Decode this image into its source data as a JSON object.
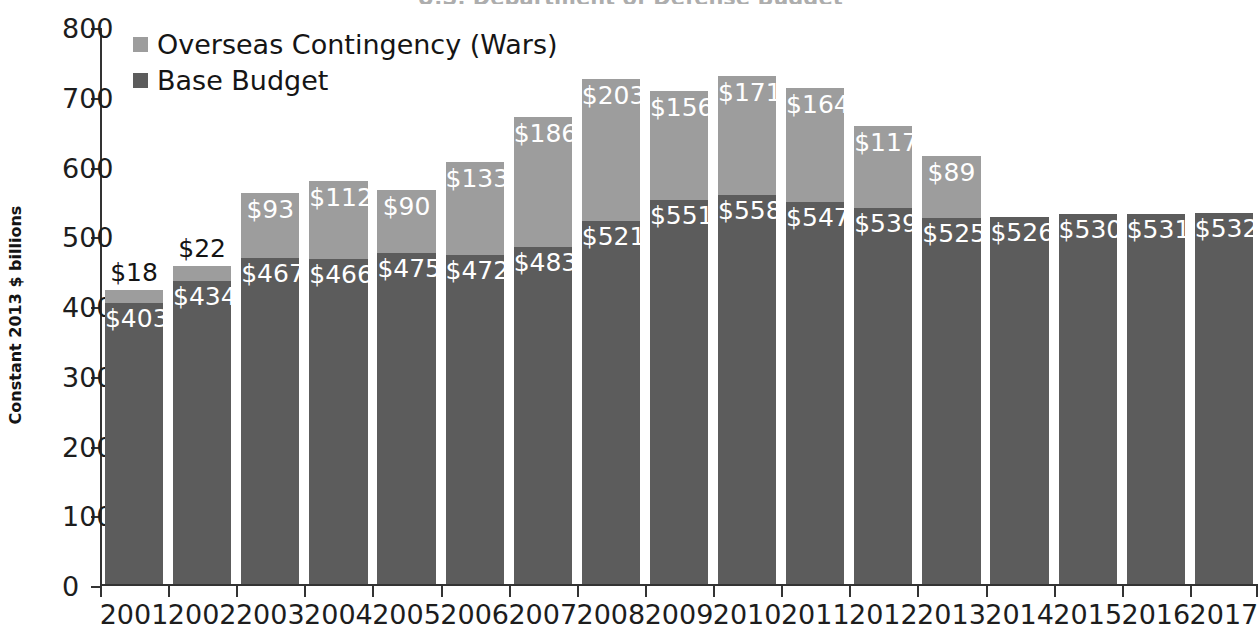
{
  "title_partial": "U.S. Department of Defense Budget",
  "axis": {
    "y_title": "Constant 2013 $ billions",
    "y_ticks": [
      "800",
      "700",
      "600",
      "500",
      "400",
      "300",
      "200",
      "100",
      "0"
    ],
    "y_min": 0,
    "y_max": 800,
    "y_step": 100
  },
  "legend": {
    "items": [
      {
        "label": "Overseas Contingency (Wars)",
        "color": "#9d9d9d",
        "swatch_name": "legend-swatch-oco"
      },
      {
        "label": "Base Budget",
        "color": "#5c5c5c",
        "swatch_name": "legend-swatch-base"
      }
    ]
  },
  "chart_data": {
    "type": "bar",
    "stacked": true,
    "title": "U.S. Department of Defense Budget",
    "xlabel": "",
    "ylabel": "Constant 2013 $ billions",
    "ylim": [
      0,
      800
    ],
    "ytick_step": 100,
    "grid": false,
    "legend_position": "top-left",
    "categories": [
      "2001",
      "2002",
      "2003",
      "2004",
      "2005",
      "2006",
      "2007",
      "2008",
      "2009",
      "2010",
      "2011",
      "2012",
      "2013",
      "2014",
      "2015",
      "2016",
      "2017"
    ],
    "series": [
      {
        "name": "Base Budget",
        "color": "#5c5c5c",
        "values": [
          403,
          434,
          467,
          466,
          475,
          472,
          483,
          521,
          551,
          558,
          547,
          539,
          525,
          526,
          530,
          531,
          532
        ],
        "labels": [
          "$403",
          "$434",
          "$467",
          "$466",
          "$475",
          "$472",
          "$483",
          "$521",
          "$551",
          "$558",
          "$547",
          "$539",
          "$525",
          "$526",
          "$530",
          "$531",
          "$532"
        ]
      },
      {
        "name": "Overseas Contingency (Wars)",
        "color": "#9d9d9d",
        "values": [
          18,
          22,
          93,
          112,
          90,
          133,
          186,
          203,
          156,
          171,
          164,
          117,
          89,
          0,
          0,
          0,
          0
        ],
        "labels": [
          "$18",
          "$22",
          "$93",
          "$112",
          "$90",
          "$133",
          "$186",
          "$203",
          "$156",
          "$171",
          "$164",
          "$117",
          "$89",
          "",
          "",
          "",
          ""
        ]
      }
    ],
    "totals": [
      421,
      456,
      560,
      578,
      565,
      605,
      669,
      724,
      707,
      729,
      711,
      656,
      614,
      526,
      530,
      531,
      532
    ]
  },
  "colors": {
    "base_budget": "#5c5c5c",
    "overseas_contingency": "#9d9d9d",
    "axis": "#333333",
    "text": "#1d1d1d",
    "background": "#ffffff"
  }
}
